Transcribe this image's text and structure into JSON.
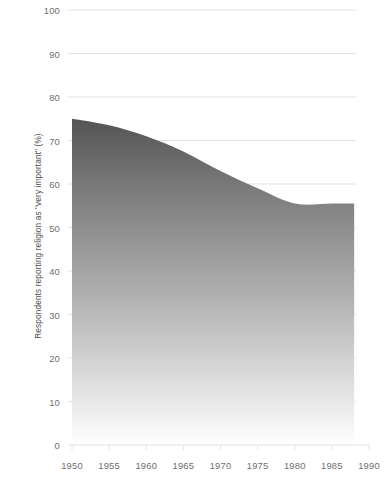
{
  "chart_data": {
    "type": "area",
    "title": "",
    "subtitle": "",
    "xlabel": "",
    "ylabel": "Respondents reporting religion as \"very important\" (%)",
    "xlim": [
      1950,
      1990
    ],
    "ylim": [
      0,
      100
    ],
    "xticks": [
      1950,
      1955,
      1960,
      1965,
      1970,
      1975,
      1980,
      1985,
      1990
    ],
    "yticks": [
      0,
      10,
      20,
      30,
      40,
      50,
      60,
      70,
      80,
      90,
      100
    ],
    "grid": "horizontal",
    "legend": "none",
    "series_name": "Religion very important",
    "x": [
      1950,
      1955,
      1960,
      1965,
      1970,
      1975,
      1980,
      1985,
      1988
    ],
    "values": [
      75,
      73.5,
      71,
      67.5,
      63,
      59,
      55.5,
      55.5,
      55.5
    ],
    "fill_top_color": "#545454",
    "fill_bottom_color": "#ffffff",
    "gridline_color": "#e2e2e2",
    "tick_label_color": "#6e6e6e",
    "axis_label_color": "#4d4d4d"
  },
  "axes": {
    "y_axis_title": "Respondents reporting religion as \"very important\" (%)",
    "y_tick_labels": [
      "100",
      "90",
      "80",
      "70",
      "60",
      "50",
      "40",
      "30",
      "20",
      "10",
      "0"
    ],
    "x_tick_labels": [
      "1950",
      "1955",
      "1960",
      "1965",
      "1970",
      "1975",
      "1980",
      "1985",
      "1990"
    ]
  }
}
